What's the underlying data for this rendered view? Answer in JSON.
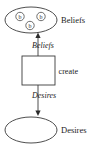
{
  "diagram": {
    "title": "Beliefs create Desires",
    "nodes": {
      "beliefs_set": {
        "label": "Beliefs",
        "shape": "ellipse",
        "tokens": [
          {
            "label": "b"
          },
          {
            "label": "b"
          },
          {
            "label": "b"
          }
        ]
      },
      "process": {
        "label": "create",
        "shape": "rectangle"
      },
      "desires_set": {
        "label": "Desires",
        "shape": "ellipse",
        "tokens": []
      }
    },
    "edges": [
      {
        "label": "Beliefs",
        "from": "process",
        "to": "beliefs_set",
        "direction": "up"
      },
      {
        "label": "Desires",
        "from": "process",
        "to": "desires_set",
        "direction": "down"
      }
    ],
    "colors": {
      "stroke": "#3a3a3a",
      "text": "#1c1c1c",
      "background": "#ffffff"
    }
  }
}
